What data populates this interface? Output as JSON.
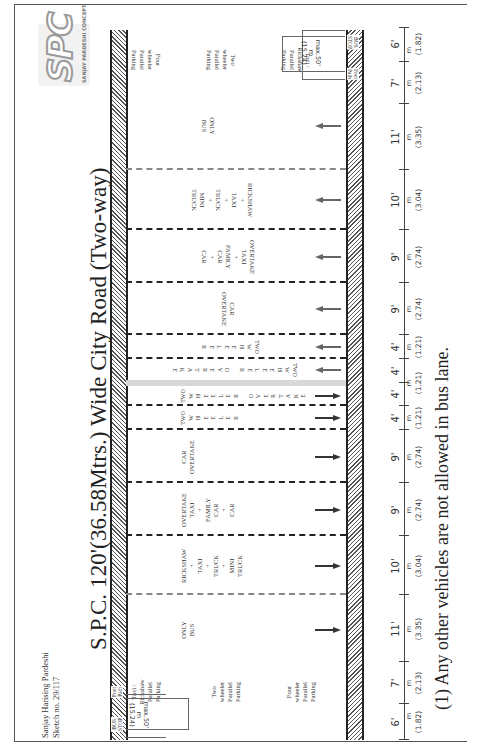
{
  "header": {
    "author": "Sanjay Harising Pardeshi",
    "sketch_no": "Sketch no.  29/117",
    "title": "S.P.C. 120'(36.58Mtrs.) Wide City Road (Two-way)"
  },
  "logo": {
    "mark": "SPC",
    "tagline": "SANJAY PARDESHI CONCEPT"
  },
  "road": {
    "total_width_ft": "120'",
    "total_width_m": "36.58",
    "footpaths": {
      "left": {
        "bus_stop": "BUS\nSTOP",
        "foot_path": "Foot\nPath"
      },
      "right": {
        "bus_stop": "BUS\nSTOP",
        "foot_path": "Foot\nPath"
      }
    },
    "parking_labels": {
      "taxi_rickshaw": "Taxi /\nRickshaw\nParallel\nParking",
      "two_wheeler": "Two\nwheeler\nParallel\nParking",
      "four_wheeler": "Four\nwheeler\nParallel\nParking"
    },
    "bus_stop_dims": {
      "inner": "max.50'\nm\n(15.24)",
      "outer": "max.70'\nm\n(21.34)"
    },
    "lanes": [
      {
        "id": "fp-l",
        "ft": "6'",
        "m": "(1.82)",
        "label": ""
      },
      {
        "id": "pk-l",
        "ft": "7'",
        "m": "(2.13)",
        "label": ""
      },
      {
        "id": "bus-l",
        "ft": "11'",
        "m": "(3.35)",
        "label": "ONLY\nBUS",
        "dir": "left"
      },
      {
        "id": "rk-l",
        "ft": "10'",
        "m": "(3.04)",
        "label": "RICKSHAW\n+\nTAXI\n+\nTRUCK\n+\nMINI\nTRUCK",
        "dir": "left"
      },
      {
        "id": "tx-l",
        "ft": "9'",
        "m": "(2.74)",
        "label": "OVERTAKE\nTAXI\n+\nFAMILY\nCAR\n+\nCAR",
        "dir": "left"
      },
      {
        "id": "co-l",
        "ft": "9'",
        "m": "(2.74)",
        "label": "CAR\nOVERTAKE",
        "dir": "left"
      },
      {
        "id": "tw-l",
        "ft": "4'",
        "m": "(1.21)",
        "label": "TWO\nW\nH\nE\nE\nL\nE\nR",
        "dir": "left"
      },
      {
        "id": "two-l",
        "ft": "4'",
        "m": "(1.21)",
        "label": "TWO\nW\nH\nE\nE\nL\nE\nR\n\nO\nV\nE\nR\nT\nA\nK\nE",
        "dir": "left"
      },
      {
        "id": "two-r",
        "ft": "4'",
        "m": "(1.21)",
        "label": "TWO\nW\nH\nE\nE\nL\nE\nR\n\nO\nV\nE\nR\nT\nA\nK\nE",
        "dir": "right"
      },
      {
        "id": "tw-r",
        "ft": "4'",
        "m": "(1.21)",
        "label": "TWO\nW\nH\nE\nE\nL\nE\nR",
        "dir": "right"
      },
      {
        "id": "co-r",
        "ft": "9'",
        "m": "(2.74)",
        "label": "CAR\nOVERTAKE",
        "dir": "right"
      },
      {
        "id": "tx-r",
        "ft": "9'",
        "m": "(2.74)",
        "label": "OVERTAKE\nTAXI\n+\nFAMILY\nCAR\n+\nCAR",
        "dir": "right"
      },
      {
        "id": "rk-r",
        "ft": "10'",
        "m": "(3.04)",
        "label": "RICKSHAW\n+\nTAXI\n+\nTRUCK\n+\nMINI\nTRUCK",
        "dir": "right"
      },
      {
        "id": "bus-r",
        "ft": "11'",
        "m": "(3.35)",
        "label": "ONLY\nBUS",
        "dir": "right"
      },
      {
        "id": "pk-r",
        "ft": "7'",
        "m": "(2.13)",
        "label": ""
      },
      {
        "id": "fp-r",
        "ft": "6'",
        "m": "(1.82)",
        "label": ""
      }
    ],
    "unit_m": "m"
  },
  "footnote": "(1) Any other vehicles are not allowed in bus lane."
}
